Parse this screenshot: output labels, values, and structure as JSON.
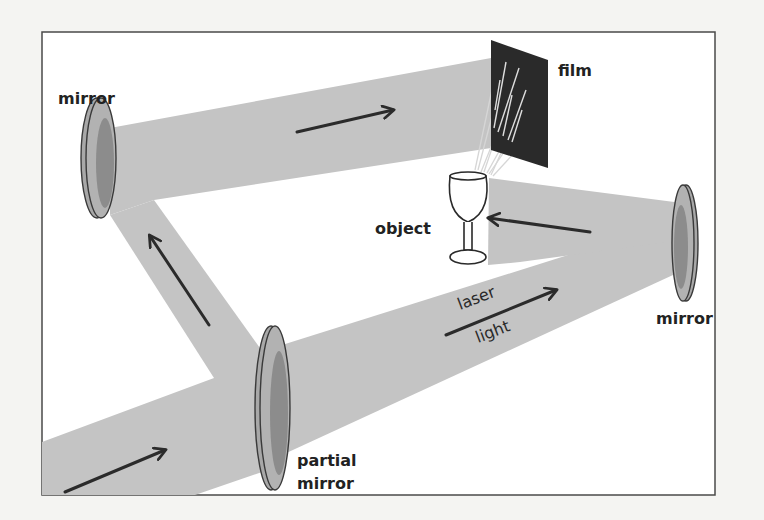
{
  "diagram": {
    "colors": {
      "background": "#f4f4f2",
      "frame": "#4a4a4a",
      "beam": "#c4c4c4",
      "mirror_face": "#a8a8a8",
      "mirror_shade": "#8a8a8a",
      "mirror_outline": "#3a3a3a",
      "film": "#2a2a2a",
      "arrow": "#2b2b2b",
      "scatter_rays": "#d8d8d8"
    },
    "labels": {
      "top_left_mirror": "mirror",
      "film": "film",
      "object": "object",
      "laser_word": "laser",
      "light_word": "light",
      "right_mirror": "mirror",
      "partial_line1": "partial",
      "partial_line2": "mirror"
    },
    "components": [
      {
        "id": "partial-mirror",
        "label": "partial mirror",
        "role": "beam splitter"
      },
      {
        "id": "top-left-mirror",
        "label": "mirror",
        "role": "reference beam reflector"
      },
      {
        "id": "right-mirror",
        "label": "mirror",
        "role": "object beam reflector"
      },
      {
        "id": "object",
        "label": "object",
        "shape": "wine glass"
      },
      {
        "id": "film",
        "label": "film",
        "role": "recording medium"
      }
    ],
    "beams": [
      {
        "from": "source",
        "to": "partial-mirror",
        "direction": "right-up"
      },
      {
        "from": "partial-mirror",
        "to": "top-left-mirror",
        "direction": "up-left"
      },
      {
        "from": "top-left-mirror",
        "to": "film",
        "direction": "right"
      },
      {
        "from": "partial-mirror",
        "to": "right-mirror",
        "direction": "right-up",
        "label": "laser light"
      },
      {
        "from": "right-mirror",
        "to": "object",
        "direction": "left"
      },
      {
        "from": "object",
        "to": "film",
        "direction": "scattered rays"
      }
    ]
  }
}
